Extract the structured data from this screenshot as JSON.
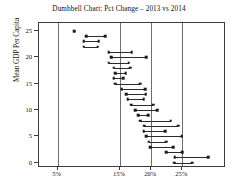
{
  "chart_data": {
    "type": "dumbbell",
    "title": "Dumbbell Chart: Pct Change – 2013 vs 2014",
    "xlabel": "",
    "ylabel": "Mean GDP Per Capita",
    "grid": true,
    "legend": false,
    "xlim": [
      2.0,
      32.0
    ],
    "ylim": [
      -1.0,
      26.5
    ],
    "xticks": [
      5,
      15,
      20,
      25
    ],
    "xtick_labels": [
      "5%",
      "15%",
      "20%",
      "25%"
    ],
    "gridline_values": [
      5,
      15,
      20,
      25
    ],
    "yticks": [
      0,
      5,
      10,
      15,
      20,
      25
    ],
    "ytick_labels": [
      "0",
      "5",
      "10",
      "15",
      "20",
      "25"
    ],
    "series": [
      {
        "name": "2013",
        "role": "start"
      },
      {
        "name": "2014",
        "role": "end"
      }
    ],
    "points": [
      {
        "y": 25,
        "start": 7.6,
        "end": 7.6
      },
      {
        "y": 24,
        "start": 9.6,
        "end": 12.6
      },
      {
        "y": 23,
        "start": 9.2,
        "end": 11.6
      },
      {
        "y": 22,
        "start": 9.2,
        "end": 11.4
      },
      {
        "y": 21,
        "start": 13.2,
        "end": 16.9
      },
      {
        "y": 20,
        "start": 13.6,
        "end": 19.2
      },
      {
        "y": 19,
        "start": 13.2,
        "end": 16.4
      },
      {
        "y": 18,
        "start": 14.0,
        "end": 16.6
      },
      {
        "y": 17,
        "start": 14.2,
        "end": 15.9
      },
      {
        "y": 16,
        "start": 14.0,
        "end": 15.5
      },
      {
        "y": 15,
        "start": 14.2,
        "end": 18.2
      },
      {
        "y": 14,
        "start": 15.3,
        "end": 19.0
      },
      {
        "y": 13,
        "start": 16.0,
        "end": 19.1
      },
      {
        "y": 12,
        "start": 16.2,
        "end": 18.8
      },
      {
        "y": 11,
        "start": 16.8,
        "end": 20.3
      },
      {
        "y": 10,
        "start": 17.4,
        "end": 21.0
      },
      {
        "y": 9,
        "start": 17.9,
        "end": 19.5
      },
      {
        "y": 8,
        "start": 18.2,
        "end": 23.1
      },
      {
        "y": 7,
        "start": 18.9,
        "end": 24.3
      },
      {
        "y": 6,
        "start": 18.8,
        "end": 22.2
      },
      {
        "y": 5,
        "start": 19.2,
        "end": 24.9
      },
      {
        "y": 4,
        "start": 19.6,
        "end": 22.4
      },
      {
        "y": 3,
        "start": 19.8,
        "end": 23.5
      },
      {
        "y": 2,
        "start": 22.4,
        "end": 25.0
      },
      {
        "y": 1,
        "start": 23.8,
        "end": 29.1
      },
      {
        "y": 0,
        "start": 23.7,
        "end": 26.6
      }
    ]
  }
}
